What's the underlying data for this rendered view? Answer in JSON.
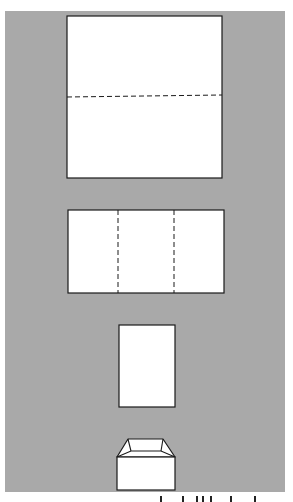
{
  "figure": {
    "background_color": "#a9a9a9",
    "paper_color": "#ffffff",
    "line_color": "#1a1a1a",
    "steps": [
      {
        "id": "step-1",
        "shape": "square-sheet",
        "rect": {
          "x": 67,
          "y": 16,
          "w": 155,
          "h": 162
        },
        "fold_lines": [
          {
            "orientation": "horizontal",
            "style": "dashed",
            "x1": 67,
            "y1": 97,
            "x2": 222,
            "y2": 95
          }
        ]
      },
      {
        "id": "step-2",
        "shape": "folded-in-half",
        "rect": {
          "x": 68,
          "y": 210,
          "w": 156,
          "h": 83
        },
        "fold_lines": [
          {
            "orientation": "vertical",
            "style": "dashed",
            "x1": 118,
            "y1": 210,
            "x2": 118,
            "y2": 293
          },
          {
            "orientation": "vertical",
            "style": "dashed",
            "x1": 174,
            "y1": 210,
            "x2": 174,
            "y2": 293
          }
        ]
      },
      {
        "id": "step-3",
        "shape": "folded-in-thirds",
        "rect": {
          "x": 119,
          "y": 325,
          "w": 56,
          "h": 82
        },
        "fold_lines": []
      },
      {
        "id": "step-4",
        "shape": "finished-box",
        "body": {
          "x": 117,
          "y": 457,
          "w": 58,
          "h": 33
        },
        "lid": {
          "outer": "117,457 128,439 163,439 175,457",
          "inner": "117,457 131,451 161,451 175,457",
          "left_crease": "128,439 131,451",
          "right_crease": "163,439 161,451"
        }
      }
    ]
  },
  "caption": {
    "visible": "cut off at bottom edge (unreadable)"
  }
}
